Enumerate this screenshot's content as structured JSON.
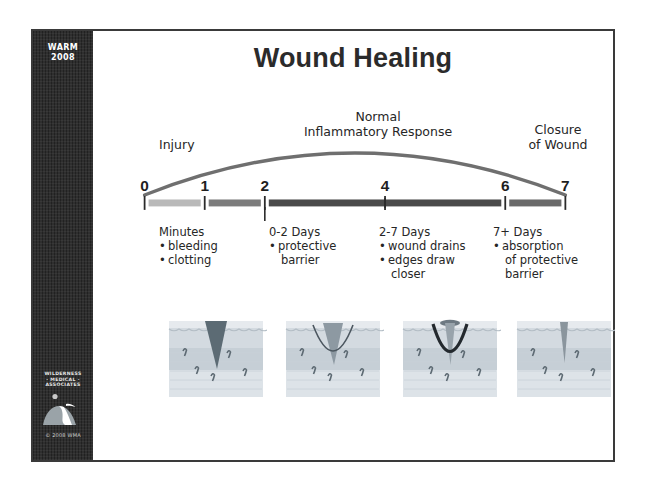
{
  "slide": {
    "title": "Wound Healing",
    "band": {
      "program_line1": "WARM",
      "program_line2": "2008",
      "logo_line1": "WILDERNESS",
      "logo_line2": "· MEDICAL ·",
      "logo_line3": "ASSOCIATES",
      "logo_icon": "mountain-logo-icon",
      "copyright": "© 2008 WMA"
    },
    "phase_labels": {
      "left": "Injury",
      "center": "Normal\nInflammatory Response",
      "right": "Closure\nof Wound"
    },
    "timeline": {
      "ticks": [
        {
          "label": "0",
          "value": 0
        },
        {
          "label": "1",
          "value": 1
        },
        {
          "label": "2",
          "value": 2
        },
        {
          "label": "4",
          "value": 4
        },
        {
          "label": "6",
          "value": 6
        },
        {
          "label": "7",
          "value": 7
        }
      ],
      "axis_min": 0,
      "axis_max": 7,
      "segments": [
        {
          "from": 0,
          "to": 1,
          "shade": "#b9b9b9"
        },
        {
          "from": 1,
          "to": 2,
          "shade": "#7c7c7c"
        },
        {
          "from": 2,
          "to": 6,
          "shade": "#4a4a4a"
        },
        {
          "from": 6,
          "to": 7,
          "shade": "#6a6a6a"
        }
      ],
      "arc_label": "normal-inflammatory-response-arc"
    },
    "phases": [
      {
        "heading": "Minutes",
        "bullets": [
          [
            "bleeding"
          ],
          [
            "clotting"
          ]
        ]
      },
      {
        "heading": "0-2 Days",
        "bullets": [
          [
            "protective",
            "barrier"
          ]
        ]
      },
      {
        "heading": "2-7 Days",
        "bullets": [
          [
            "wound drains"
          ],
          [
            "edges draw",
            "closer"
          ]
        ]
      },
      {
        "heading": "7+ Days",
        "bullets": [
          [
            "absorption",
            "of protective",
            "barrier"
          ]
        ]
      }
    ],
    "panels": [
      {
        "name": "skin-panel-injury",
        "caption_ref": "Minutes"
      },
      {
        "name": "skin-panel-protective-barrier",
        "caption_ref": "0-2 Days"
      },
      {
        "name": "skin-panel-wound-drains",
        "caption_ref": "2-7 Days"
      },
      {
        "name": "skin-panel-closure",
        "caption_ref": "7+ Days"
      }
    ],
    "colors": {
      "band": "#2f2f2f",
      "frame": "#3a3a3a",
      "text": "#262626",
      "arc": "#6f6f6f",
      "skin_light": "#d7dde2",
      "skin_mid": "#c2cbd3",
      "wound": "#5c6b74"
    }
  },
  "chart_data": {
    "type": "line",
    "title": "Wound Healing",
    "xlabel": "Days",
    "ylabel": "Inflammatory Response",
    "x": [
      0,
      1,
      2,
      4,
      6,
      7
    ],
    "tick_labels": [
      "0",
      "1",
      "2",
      "4",
      "6",
      "7"
    ],
    "xlim": [
      0,
      7
    ],
    "grid": false,
    "legend": "none",
    "series": [
      {
        "name": "Normal Inflammatory Response",
        "x": [
          0,
          1,
          2,
          3,
          3.5,
          4,
          5,
          6,
          7
        ],
        "values": [
          0,
          0.62,
          0.86,
          0.98,
          1.0,
          0.98,
          0.86,
          0.62,
          0
        ]
      }
    ],
    "annotations": [
      {
        "text": "Injury",
        "x": 0
      },
      {
        "text": "Normal Inflammatory Response",
        "x": 3.5
      },
      {
        "text": "Closure of Wound",
        "x": 7
      }
    ],
    "phase_bands": [
      {
        "label": "Minutes",
        "from": 0,
        "to": 1
      },
      {
        "label": "0-2 Days",
        "from": 1,
        "to": 2
      },
      {
        "label": "2-7 Days",
        "from": 2,
        "to": 6
      },
      {
        "label": "7+ Days",
        "from": 6,
        "to": 7
      }
    ]
  }
}
